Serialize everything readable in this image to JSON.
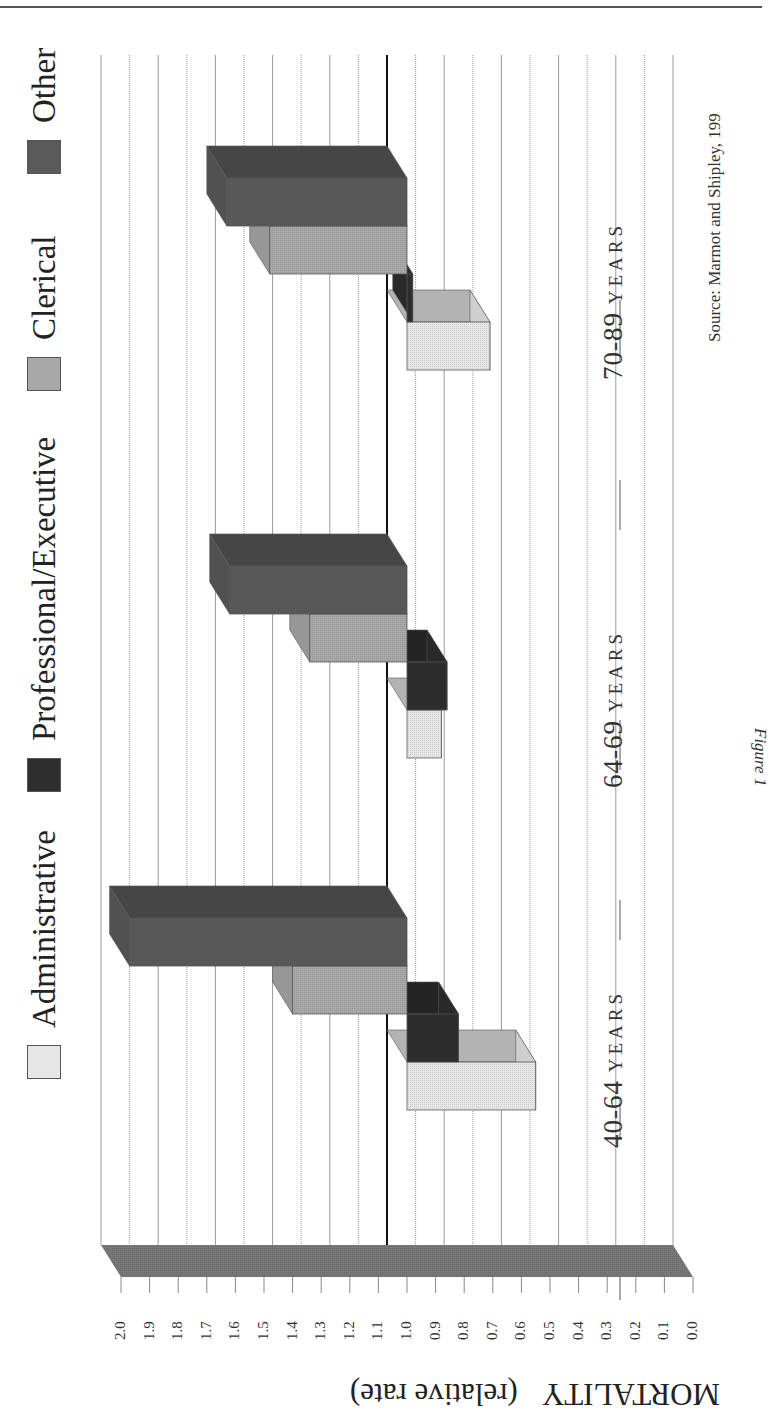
{
  "figure": {
    "caption": "Figure 1",
    "source": "Source: Marmot and Shipley, 199"
  },
  "legend": {
    "items": [
      {
        "label": "Administrative",
        "color": "#e6e6e6"
      },
      {
        "label": "Professional/Executive",
        "color": "#2e2e2e"
      },
      {
        "label": "Clerical",
        "color": "#a8a8a8"
      },
      {
        "label": "Other",
        "color": "#5a5a5a"
      }
    ]
  },
  "axis": {
    "title_main": "MORTALITY",
    "title_sub": "(relative rate)",
    "ticks": [
      "2.0",
      "1.9",
      "1.8",
      "1.7",
      "1.6",
      "1.5",
      "1.4",
      "1.3",
      "1.2",
      "1.1",
      "1.0",
      "0.9",
      "0.8",
      "0.7",
      "0.6",
      "0.5",
      "0.4",
      "0.3",
      "0.2",
      "0.1",
      "0.0"
    ]
  },
  "groups": [
    {
      "num": "40-64",
      "unit": "YEARS"
    },
    {
      "num": "64-69",
      "unit": "YEARS"
    },
    {
      "num": "70-89",
      "unit": "YEARS"
    }
  ],
  "chart_data": {
    "type": "bar",
    "title": "Figure 1",
    "subtitle": "Source: Marmot and Shipley, 199",
    "xlabel": "Age group",
    "ylabel": "MORTALITY (relative rate)",
    "ylim": [
      0.0,
      2.0
    ],
    "baseline": 1.0,
    "grid": true,
    "legend_position": "top",
    "orientation": "3D column chart, page rotated 90°",
    "categories": [
      "40-64 YEARS",
      "64-69 YEARS",
      "70-89 YEARS"
    ],
    "series": [
      {
        "name": "Administrative",
        "values": [
          0.55,
          0.88,
          0.71
        ]
      },
      {
        "name": "Professional/Executive",
        "values": [
          0.82,
          0.86,
          0.98
        ]
      },
      {
        "name": "Clerical",
        "values": [
          1.4,
          1.34,
          1.48
        ]
      },
      {
        "name": "Other",
        "values": [
          1.97,
          1.62,
          1.63
        ]
      }
    ]
  }
}
